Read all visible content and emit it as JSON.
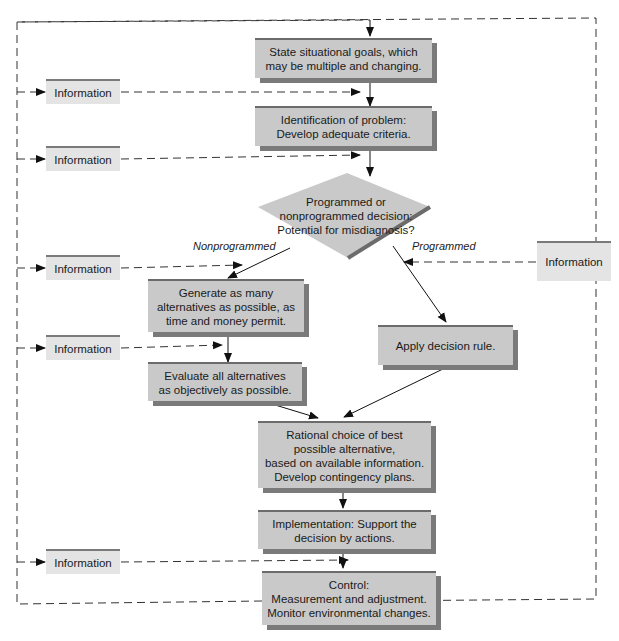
{
  "diagram": {
    "type": "flowchart",
    "steps": {
      "goals": "State situational goals, which\nmay be multiple and changing.",
      "problem": "Identification of problem:\nDevelop adequate criteria.",
      "decision": "Programmed or\nnonprogrammed decision:\nPotential for misdiagnosis?",
      "generate": "Generate as many\nalternatives as possible, as\ntime and money permit.",
      "evaluate": "Evaluate all alternatives\nas objectively as possible.",
      "apply_rule": "Apply decision rule.",
      "choice": "Rational choice of best\npossible alternative,\nbased on available information.\nDevelop contingency plans.",
      "implementation": "Implementation: Support the\ndecision by actions.",
      "control": "Control:\nMeasurement and adjustment.\nMonitor environmental changes."
    },
    "branch_labels": {
      "nonprogrammed": "Nonprogrammed",
      "programmed": "Programmed"
    },
    "information_boxes": [
      {
        "label": "Information",
        "target": "goals-to-problem"
      },
      {
        "label": "Information",
        "target": "problem-to-decision"
      },
      {
        "label": "Information",
        "target": "generate"
      },
      {
        "label": "Information",
        "target": "evaluate"
      },
      {
        "label": "Information",
        "target": "apply_rule"
      },
      {
        "label": "Information",
        "target": "control"
      }
    ],
    "colors": {
      "step_fill": "#c9c9c9",
      "step_shadow": "#7a7a7a",
      "info_fill": "#e4e4e4"
    }
  }
}
